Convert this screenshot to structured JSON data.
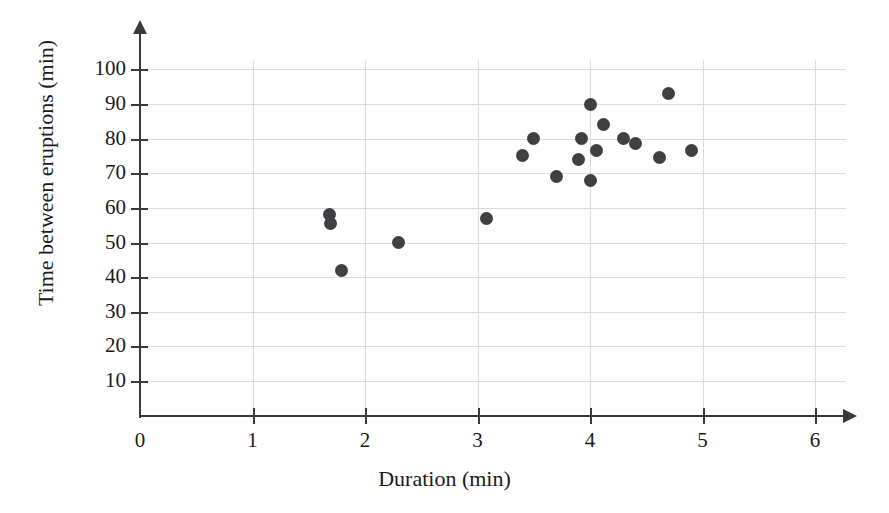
{
  "chart_data": {
    "type": "scatter",
    "title": "",
    "xlabel": "Duration (min)",
    "ylabel": "Time between eruptions (min)",
    "xlim": [
      0,
      6
    ],
    "ylim": [
      0,
      105
    ],
    "x_ticks": [
      0,
      1,
      2,
      3,
      4,
      5,
      6
    ],
    "y_ticks": [
      10,
      20,
      30,
      40,
      50,
      60,
      70,
      80,
      90,
      100
    ],
    "x_tick_labels": [
      "0",
      "1",
      "2",
      "3",
      "4",
      "5",
      "6"
    ],
    "y_tick_labels": [
      "10",
      "20",
      "30",
      "40",
      "50",
      "60",
      "70",
      "80",
      "90",
      "100"
    ],
    "grid": true,
    "grid_color": "#dcdcdc",
    "axis_color": "#3a3a3a",
    "marker_color": "#3f3f44",
    "marker_size": 13,
    "legend": null,
    "points": [
      {
        "x": 1.68,
        "y": 58.0
      },
      {
        "x": 1.69,
        "y": 55.5
      },
      {
        "x": 1.79,
        "y": 42.0
      },
      {
        "x": 2.3,
        "y": 50.0
      },
      {
        "x": 3.08,
        "y": 57.0
      },
      {
        "x": 3.4,
        "y": 75.0
      },
      {
        "x": 3.5,
        "y": 80.0
      },
      {
        "x": 3.7,
        "y": 69.0
      },
      {
        "x": 3.9,
        "y": 74.0
      },
      {
        "x": 3.92,
        "y": 80.0
      },
      {
        "x": 4.0,
        "y": 90.0
      },
      {
        "x": 4.0,
        "y": 68.0
      },
      {
        "x": 4.06,
        "y": 76.5
      },
      {
        "x": 4.12,
        "y": 84.0
      },
      {
        "x": 4.3,
        "y": 80.0
      },
      {
        "x": 4.4,
        "y": 78.5
      },
      {
        "x": 4.62,
        "y": 74.5
      },
      {
        "x": 4.7,
        "y": 93.0
      },
      {
        "x": 4.9,
        "y": 76.5
      }
    ]
  }
}
